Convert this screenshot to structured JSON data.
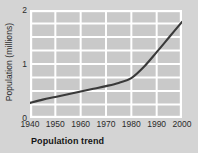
{
  "caption": "Population trend",
  "colors": {
    "page_background": "#d4d4d4",
    "plot_background": "#c9c9c9",
    "gridline": "#ffffff",
    "line": "#3a3a3a",
    "text": "#2b2b2b"
  },
  "chart_data": {
    "type": "line",
    "title": "Population trend",
    "xlabel": "",
    "ylabel": "Population (millions)",
    "xlim": [
      1940,
      2000
    ],
    "ylim": [
      0,
      2
    ],
    "xticks": [
      1940,
      1950,
      1960,
      1970,
      1980,
      1990,
      2000
    ],
    "xtick_labels": [
      "1940",
      "1950",
      "1960",
      "1970",
      "1980",
      "1990",
      "2000"
    ],
    "yticks": [
      0,
      1,
      2
    ],
    "ytick_labels": [
      "0",
      "1",
      "2"
    ],
    "grid": true,
    "grid_x_values": [
      1950,
      1960,
      1970,
      1980,
      1990
    ],
    "grid_y_values": [
      0.25,
      0.5,
      0.75,
      1,
      1.25,
      1.5,
      1.75
    ],
    "legend": null,
    "series": [
      {
        "name": "Population",
        "x": [
          1940,
          1945,
          1950,
          1955,
          1960,
          1965,
          1970,
          1975,
          1980,
          1985,
          1990,
          1995,
          2000
        ],
        "values": [
          0.28,
          0.34,
          0.39,
          0.44,
          0.49,
          0.54,
          0.59,
          0.65,
          0.74,
          0.95,
          1.22,
          1.5,
          1.78
        ]
      }
    ]
  }
}
